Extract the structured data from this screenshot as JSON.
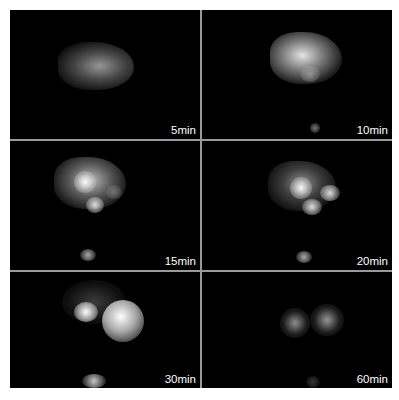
{
  "figure": {
    "layout": {
      "rows": 3,
      "cols": 2
    },
    "panels": [
      {
        "label": "5min"
      },
      {
        "label": "10min"
      },
      {
        "label": "15min"
      },
      {
        "label": "20min"
      },
      {
        "label": "30min"
      },
      {
        "label": "60min"
      }
    ],
    "colors": {
      "background": "#000000",
      "divider": "#9a9a9a",
      "label": "#ffffff",
      "page": "#ffffff"
    }
  }
}
